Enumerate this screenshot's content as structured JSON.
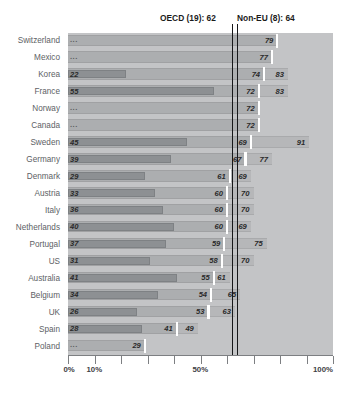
{
  "chart_data": {
    "type": "bar",
    "title": "",
    "xlabel": "",
    "ylabel": "",
    "xlim": [
      0,
      100
    ],
    "grid": false,
    "legend_position": "none",
    "orientation": "horizontal",
    "axis_ticks": [
      "0%",
      "10%",
      "50%",
      "100%"
    ],
    "axis_tick_values": [
      0,
      10,
      50,
      100
    ],
    "minor_tick_values": [
      0,
      10,
      20,
      30,
      40,
      50,
      60,
      70,
      80,
      90,
      100
    ],
    "missing_value_marker": "...",
    "reference_lines": [
      {
        "name": "OECD (19)",
        "label": "OECD (19): 62",
        "value": 62
      },
      {
        "name": "Non-EU (8)",
        "label": "Non-EU (8): 64",
        "value": 64
      }
    ],
    "series": [
      {
        "name": "inner",
        "key": "v1"
      },
      {
        "name": "middle",
        "key": "v2"
      },
      {
        "name": "outer",
        "key": "v3"
      }
    ],
    "categories": [
      "Switzerland",
      "Mexico",
      "Korea",
      "France",
      "Norway",
      "Canada",
      "Sweden",
      "Germany",
      "Denmark",
      "Austria",
      "Italy",
      "Netherlands",
      "Portugal",
      "US",
      "Australia",
      "Belgium",
      "UK",
      "Spain",
      "Poland"
    ],
    "rows": [
      {
        "label": "Switzerland",
        "v1": null,
        "v2": 79,
        "v3": null
      },
      {
        "label": "Mexico",
        "v1": null,
        "v2": 77,
        "v3": null
      },
      {
        "label": "Korea",
        "v1": 22,
        "v2": 74,
        "v3": 83
      },
      {
        "label": "France",
        "v1": 55,
        "v2": 72,
        "v3": 83
      },
      {
        "label": "Norway",
        "v1": null,
        "v2": 72,
        "v3": null
      },
      {
        "label": "Canada",
        "v1": null,
        "v2": 72,
        "v3": null
      },
      {
        "label": "Sweden",
        "v1": 45,
        "v2": 69,
        "v3": 91
      },
      {
        "label": "Germany",
        "v1": 39,
        "v2": 67,
        "v3": 77
      },
      {
        "label": "Denmark",
        "v1": 29,
        "v2": 61,
        "v3": 69
      },
      {
        "label": "Austria",
        "v1": 33,
        "v2": 60,
        "v3": 70
      },
      {
        "label": "Italy",
        "v1": 36,
        "v2": 60,
        "v3": 70
      },
      {
        "label": "Netherlands",
        "v1": 40,
        "v2": 60,
        "v3": 69
      },
      {
        "label": "Portugal",
        "v1": 37,
        "v2": 59,
        "v3": 75
      },
      {
        "label": "US",
        "v1": 31,
        "v2": 58,
        "v3": 70
      },
      {
        "label": "Australia",
        "v1": 41,
        "v2": 55,
        "v3": 61
      },
      {
        "label": "Belgium",
        "v1": 34,
        "v2": 54,
        "v3": 65
      },
      {
        "label": "UK",
        "v1": 26,
        "v2": 53,
        "v3": 63
      },
      {
        "label": "Spain",
        "v1": 28,
        "v2": 41,
        "v3": 49
      },
      {
        "label": "Poland",
        "v1": null,
        "v2": 29,
        "v3": null
      }
    ]
  },
  "colors": {
    "plot_background": "#c3c4c6",
    "bar_inner": "#8d9093",
    "bar_middle": "#acaeb0",
    "bar_outer": "#b6b7b9",
    "reference_line": "#17181a",
    "tick_marker": "#ffffff",
    "label_text": "#5d6165",
    "value_text": "#2a2a2a"
  }
}
